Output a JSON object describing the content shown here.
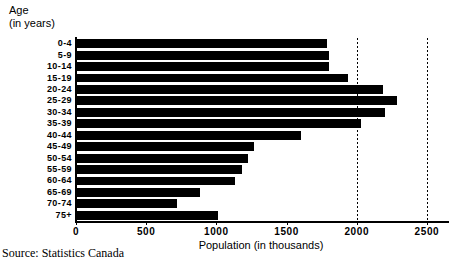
{
  "chart_data": {
    "type": "bar",
    "orientation": "horizontal",
    "title": "",
    "xlabel": "Population (in thousands)",
    "ylabel": "Age\n(in years)",
    "categories": [
      "0-4",
      "5-9",
      "10-14",
      "15-19",
      "20-24",
      "25-29",
      "30-34",
      "35-39",
      "40-44",
      "45-49",
      "50-54",
      "55-59",
      "60-64",
      "65-69",
      "70-74",
      "75+"
    ],
    "values": [
      1790,
      1800,
      1805,
      1935,
      2185,
      2285,
      2200,
      2030,
      1600,
      1270,
      1225,
      1180,
      1130,
      880,
      720,
      1010
    ],
    "xlim": [
      0,
      2650
    ],
    "xticks": [
      0,
      500,
      1000,
      1500,
      2000,
      2500
    ],
    "xticklabels": [
      "0",
      "500",
      "1000",
      "1500",
      "2000",
      "2500"
    ],
    "gridlines_at": [
      2000,
      2500
    ],
    "grid": true,
    "legend": "none",
    "bar_color": "#000000",
    "source": "Source: Statistics Canada"
  },
  "axes": {
    "y_title_line1": "Age",
    "y_title_line2": "(in years)",
    "x_title": "Population (in thousands)"
  },
  "footer": {
    "source": "Source: Statistics Canada"
  }
}
